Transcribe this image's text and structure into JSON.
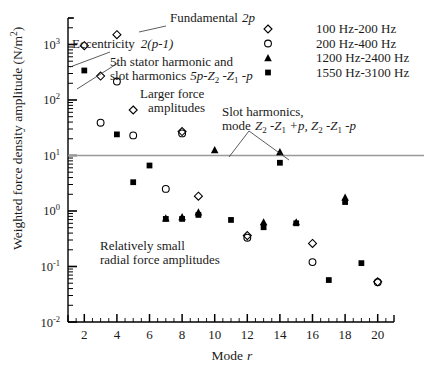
{
  "chart_data": {
    "type": "scatter",
    "title": "",
    "xlabel": "Mode r",
    "ylabel": "Weighted force density amplitude (N/m2)",
    "ylabel_display": "Weighted force density amplitude (N/m",
    "ylabel_unit_sup": "2",
    "ylabel_tail": ")",
    "xlim": [
      1,
      21
    ],
    "ylim": [
      0.01,
      3000
    ],
    "yscale": "log",
    "xscale": "linear",
    "grid": false,
    "legend_position": "top-right",
    "xticks": [
      2,
      4,
      6,
      8,
      10,
      12,
      14,
      16,
      18,
      20
    ],
    "xtick_labels": [
      "2",
      "4",
      "6",
      "8",
      "10",
      "12",
      "14",
      "16",
      "18",
      "20"
    ],
    "yticks": [
      0.01,
      0.1,
      1,
      10,
      100,
      1000
    ],
    "ytick_labels": [
      "10-2",
      "10-1",
      "100",
      "101",
      "102",
      "103"
    ],
    "ytick_mantissa": "10",
    "ytick_exponents": [
      "-2",
      "-1",
      "0",
      "1",
      "2",
      "3"
    ],
    "reference_line": {
      "y": 10,
      "color": "#999999",
      "label": ""
    },
    "series": [
      {
        "name": "100 Hz-200 Hz",
        "marker": "diamond-open",
        "color": "#000000",
        "points": [
          {
            "x": 2,
            "y": 950
          },
          {
            "x": 3,
            "y": 270
          },
          {
            "x": 4,
            "y": 1500
          },
          {
            "x": 5,
            "y": 66
          },
          {
            "x": 8,
            "y": 27
          },
          {
            "x": 9,
            "y": 1.85
          },
          {
            "x": 12,
            "y": 0.36
          },
          {
            "x": 16,
            "y": 0.26
          },
          {
            "x": 20,
            "y": 0.053
          }
        ]
      },
      {
        "name": "200 Hz-400 Hz",
        "marker": "circle-open",
        "color": "#000000",
        "points": [
          {
            "x": 3,
            "y": 39
          },
          {
            "x": 4,
            "y": 215
          },
          {
            "x": 5,
            "y": 23
          },
          {
            "x": 7,
            "y": 2.5
          },
          {
            "x": 8,
            "y": 25
          },
          {
            "x": 12,
            "y": 0.33
          },
          {
            "x": 16,
            "y": 0.12
          },
          {
            "x": 20,
            "y": 0.052
          }
        ]
      },
      {
        "name": "1200 Hz-2400 Hz",
        "marker": "triangle-filled",
        "color": "#000000",
        "points": [
          {
            "x": 7,
            "y": 0.74
          },
          {
            "x": 8,
            "y": 0.78
          },
          {
            "x": 9,
            "y": 0.95
          },
          {
            "x": 10,
            "y": 12.5
          },
          {
            "x": 13,
            "y": 0.63
          },
          {
            "x": 14,
            "y": 11.5
          },
          {
            "x": 15,
            "y": 0.63
          },
          {
            "x": 18,
            "y": 1.75
          }
        ]
      },
      {
        "name": "1550 Hz-3100 Hz",
        "marker": "square-filled",
        "color": "#000000",
        "points": [
          {
            "x": 2,
            "y": 340
          },
          {
            "x": 4,
            "y": 24
          },
          {
            "x": 5,
            "y": 3.3
          },
          {
            "x": 6,
            "y": 6.6
          },
          {
            "x": 7,
            "y": 0.72
          },
          {
            "x": 8,
            "y": 0.72
          },
          {
            "x": 9,
            "y": 0.85
          },
          {
            "x": 11,
            "y": 0.69
          },
          {
            "x": 13,
            "y": 0.51
          },
          {
            "x": 14,
            "y": 7.4
          },
          {
            "x": 15,
            "y": 0.6
          },
          {
            "x": 17,
            "y": 0.057
          },
          {
            "x": 18,
            "y": 1.45
          },
          {
            "x": 19,
            "y": 0.115
          }
        ]
      }
    ],
    "annotations": [
      {
        "id": "fundamental",
        "text": "Fundamental 2p",
        "italic_tail": "2p"
      },
      {
        "id": "eccentricity",
        "text": "Eccentricity 2(p-1)",
        "italic_tail": "2(p-1)"
      },
      {
        "id": "stator-harmonic-line1",
        "text": "5th stator harmonic and"
      },
      {
        "id": "stator-harmonic-line2",
        "text": "slot harmonics 5p-Z2 -Z1 -p"
      },
      {
        "id": "larger-force-line1",
        "text": "Larger force"
      },
      {
        "id": "larger-force-line2",
        "text": "amplitudes"
      },
      {
        "id": "slot-harmonics-line1",
        "text": "Slot harmonics,"
      },
      {
        "id": "slot-harmonics-line2",
        "text": "mode Z2 -Z1 +p, Z2 -Z1 -p"
      },
      {
        "id": "small-radial-line1",
        "text": "Relatively small"
      },
      {
        "id": "small-radial-line2",
        "text": "radial force amplitudes"
      }
    ]
  },
  "legend": {
    "entries": [
      {
        "label": "100 Hz-200 Hz",
        "marker": "diamond-open"
      },
      {
        "label": "200 Hz-400 Hz",
        "marker": "circle-open"
      },
      {
        "label": "1200 Hz-2400 Hz",
        "marker": "triangle-filled"
      },
      {
        "label": "1550 Hz-3100 Hz",
        "marker": "square-filled"
      }
    ]
  },
  "annotation_text": {
    "fundamental": "Fundamental",
    "fundamental_em": "2p",
    "eccentricity": "Eccentricity",
    "eccentricity_em": "2(p-1)",
    "stator1": "5th stator harmonic and",
    "stator2_pre": "slot harmonics",
    "stator2_em_a": "5p-Z",
    "stator2_sub_a": "2",
    "stator2_em_b": " -Z",
    "stator2_sub_b": "1",
    "stator2_em_c": " -p",
    "larger1": "Larger force",
    "larger2": "amplitudes",
    "slot1": "Slot harmonics,",
    "slot2_pre": "mode",
    "slot2_em_a": "Z",
    "slot2_sub_a": "2",
    "slot2_em_b": " -Z",
    "slot2_sub_b": "1",
    "slot2_em_c": " +p, ",
    "slot2_em_d": "Z",
    "slot2_sub_c": "2",
    "slot2_em_e": " -Z",
    "slot2_sub_d": "1",
    "slot2_em_f": " -p",
    "small1": "Relatively small",
    "small2": "radial force amplitudes"
  },
  "axes": {
    "x_label_pre": "Mode",
    "x_label_em": "r",
    "y_label_pre": "Weighted force density amplitude (N/m",
    "y_label_sup": "2",
    "y_label_post": ")"
  }
}
